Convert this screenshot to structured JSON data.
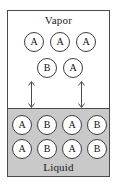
{
  "diagram": {
    "colors": {
      "liquid_fill": "#c9c9c9",
      "vapor_fill": "#ffffff",
      "outline": "#4a4a4a",
      "molecule_outline": "#3c3c3c",
      "text": "#111111"
    },
    "vapor": {
      "label": "Vapor",
      "rows": [
        {
          "molecules": [
            {
              "species": "A",
              "x": 16,
              "y": 21
            },
            {
              "species": "A",
              "x": 42,
              "y": 21
            },
            {
              "species": "A",
              "x": 68,
              "y": 21
            }
          ]
        },
        {
          "molecules": [
            {
              "species": "B",
              "x": 29,
              "y": 47
            },
            {
              "species": "A",
              "x": 55,
              "y": 47
            }
          ]
        }
      ]
    },
    "liquid": {
      "label": "Liquid",
      "rows": [
        {
          "molecules": [
            {
              "species": "A",
              "x": 4,
              "y": 6
            },
            {
              "species": "B",
              "x": 29,
              "y": 6
            },
            {
              "species": "A",
              "x": 54,
              "y": 6
            },
            {
              "species": "B",
              "x": 79,
              "y": 6
            }
          ]
        },
        {
          "molecules": [
            {
              "species": "A",
              "x": 4,
              "y": 30
            },
            {
              "species": "B",
              "x": 29,
              "y": 30
            },
            {
              "species": "A",
              "x": 54,
              "y": 30
            },
            {
              "species": "B",
              "x": 79,
              "y": 30
            }
          ]
        }
      ]
    },
    "transfer_arrows": [
      {
        "name": "left",
        "x": 19,
        "y": 70
      },
      {
        "name": "right",
        "x": 69,
        "y": 70
      }
    ]
  }
}
